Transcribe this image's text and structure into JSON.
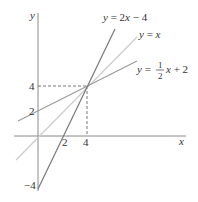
{
  "diagram": {
    "type": "line-graph",
    "axes": {
      "x_label": "x",
      "y_label": "y",
      "x_ticks": [
        "2",
        "4"
      ],
      "y_ticks": [
        "4",
        "2",
        "−4"
      ]
    },
    "lines": [
      {
        "name": "y = 2x − 4",
        "label_lhs": "y = 2",
        "label_var": "x",
        "label_rhs": " − 4",
        "slope": 2,
        "intercept": -4,
        "color": "#777777"
      },
      {
        "name": "y = x",
        "label_lhs": "y = ",
        "label_var": "x",
        "slope": 1,
        "intercept": 0,
        "color": "#c8c8c8"
      },
      {
        "name": "y = 1/2 x + 2",
        "label_lhs": "y = ",
        "frac_num": "1",
        "frac_den": "2",
        "label_var": "x",
        "label_rhs": " + 2",
        "slope": 0.5,
        "intercept": 2,
        "color": "#999999"
      }
    ],
    "intersection": {
      "x": 4,
      "y": 4
    },
    "colors": {
      "axis": "#888888",
      "dashed": "#555555",
      "text": "#333333"
    }
  }
}
